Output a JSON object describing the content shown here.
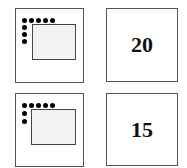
{
  "rows": [
    {
      "pattern": {
        "top_dots": 5,
        "left_dots_below_corner": 3,
        "shaded_region": "dotted rectangle"
      },
      "value": "20"
    },
    {
      "pattern": {
        "top_dots": 5,
        "left_dots_below_corner": 2,
        "shaded_region": "dotted rectangle"
      },
      "value": "15"
    }
  ],
  "colors": {
    "border": "#555555",
    "dot": "#000000",
    "text": "#111111"
  }
}
